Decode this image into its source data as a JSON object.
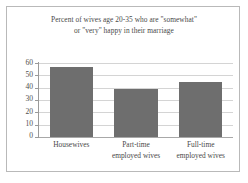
{
  "chart_data": {
    "type": "bar",
    "title": "Percent of wives age 20-35 who are \"somewhat\" or \"very\" happy in their marriage",
    "title_lines": [
      "Percent of wives age 20-35 who are \"somewhat\"",
      "or \"very\" happy in their marriage"
    ],
    "categories": [
      "Housewives",
      "Part-time employed wives",
      "Full-time employed wives"
    ],
    "category_lines": [
      [
        "Housewives"
      ],
      [
        "Part-time",
        "employed wives"
      ],
      [
        "Full-time",
        "employed wives"
      ]
    ],
    "values": [
      57,
      39,
      45
    ],
    "xlabel": "",
    "ylabel": "",
    "ylim": [
      0,
      60
    ],
    "yticks": [
      60,
      50,
      40,
      30,
      20,
      10,
      0
    ],
    "ytick_labels": [
      "60",
      "50",
      "40",
      "30",
      "20",
      "10",
      "0"
    ],
    "grid": true,
    "grid_axis": "y",
    "legend": false,
    "legend_position": "none",
    "bar_color": "#6e6e6e",
    "gridline_color": "#d4d4d4",
    "axis_color": "#9a9a9a",
    "frame_color": "#b9b9b9",
    "text_color": "#4a4a4a"
  }
}
